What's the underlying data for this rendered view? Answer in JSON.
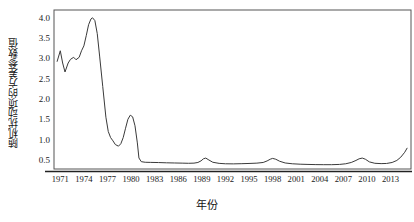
{
  "chart_data": {
    "type": "line",
    "title": "",
    "xlabel": "年份",
    "ylabel": "随机扰动项的方差参数值",
    "xlim": [
      1970.2,
      2015.6
    ],
    "ylim": [
      0.28,
      4.18
    ],
    "grid": false,
    "legend": null,
    "line_color": "#3a3a3a",
    "yticks": [
      "0.5",
      "1.0",
      "1.5",
      "2.0",
      "2.5",
      "3.0",
      "3.5",
      "4.0"
    ],
    "ytick_values": [
      0.5,
      1.0,
      1.5,
      2.0,
      2.5,
      3.0,
      3.5,
      4.0
    ],
    "xticks": [
      "1971",
      "1974",
      "1977",
      "1980",
      "1983",
      "1986",
      "1989",
      "1992",
      "1995",
      "1998",
      "2001",
      "2004",
      "2007",
      "2010",
      "2013"
    ],
    "xtick_values": [
      1971,
      1974,
      1977,
      1980,
      1983,
      1986,
      1989,
      1992,
      1995,
      1998,
      2001,
      2004,
      2007,
      2010,
      2013
    ],
    "series": [
      {
        "name": "随机扰动项的方差参数值",
        "x": [
          1970.6,
          1971.0,
          1971.3,
          1971.6,
          1972.0,
          1972.3,
          1972.7,
          1973.0,
          1973.4,
          1973.7,
          1974.0,
          1974.3,
          1974.6,
          1974.9,
          1975.1,
          1975.4,
          1975.7,
          1976.0,
          1976.4,
          1976.8,
          1977.1,
          1977.4,
          1977.7,
          1978.0,
          1978.4,
          1978.7,
          1979.0,
          1979.3,
          1979.6,
          1979.9,
          1980.2,
          1980.5,
          1980.8,
          1981.0,
          1981.3,
          1981.8,
          1982.5,
          1983.5,
          1984.5,
          1985.5,
          1986.5,
          1987.3,
          1988.0,
          1988.5,
          1988.9,
          1989.2,
          1989.5,
          1989.9,
          1990.4,
          1991.2,
          1992.0,
          1993.0,
          1994.0,
          1995.0,
          1996.0,
          1996.8,
          1997.3,
          1997.7,
          1998.0,
          1998.4,
          1998.9,
          1999.6,
          2000.5,
          2001.5,
          2002.5,
          2003.5,
          2004.5,
          2005.5,
          2006.5,
          2007.3,
          2008.0,
          2008.6,
          2009.0,
          2009.4,
          2009.8,
          2010.3,
          2011.0,
          2011.8,
          2012.5,
          2013.2,
          2013.8,
          2014.3,
          2014.8,
          2015.1
        ],
        "y": [
          2.92,
          3.18,
          2.88,
          2.66,
          2.88,
          2.97,
          3.02,
          2.96,
          3.02,
          3.18,
          3.3,
          3.55,
          3.82,
          3.96,
          3.99,
          3.92,
          3.6,
          3.05,
          2.3,
          1.55,
          1.2,
          1.05,
          0.97,
          0.88,
          0.84,
          0.9,
          1.05,
          1.28,
          1.5,
          1.6,
          1.56,
          1.34,
          0.92,
          0.55,
          0.46,
          0.445,
          0.442,
          0.438,
          0.432,
          0.428,
          0.424,
          0.42,
          0.424,
          0.44,
          0.48,
          0.53,
          0.548,
          0.5,
          0.445,
          0.418,
          0.408,
          0.406,
          0.41,
          0.416,
          0.424,
          0.44,
          0.478,
          0.52,
          0.54,
          0.52,
          0.47,
          0.428,
          0.408,
          0.398,
          0.392,
          0.388,
          0.386,
          0.386,
          0.392,
          0.408,
          0.44,
          0.49,
          0.53,
          0.548,
          0.52,
          0.455,
          0.42,
          0.412,
          0.416,
          0.44,
          0.49,
          0.57,
          0.69,
          0.79
        ]
      }
    ],
    "annotations": [
      {
        "text": "峰值",
        "x": 1975.1,
        "y": 3.99,
        "visible": false
      }
    ]
  },
  "axes": {
    "y_title": "随机扰动项的方差参数值",
    "x_title": "年份"
  }
}
